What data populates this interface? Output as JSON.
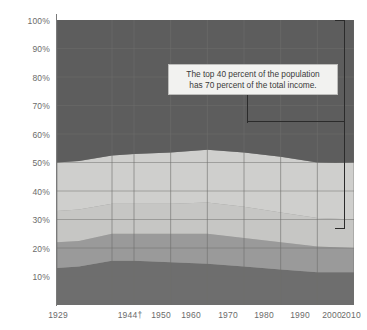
{
  "chart_data": {
    "type": "area",
    "title": "",
    "subtitle": "",
    "xlabel": "",
    "ylabel": "",
    "stacked": true,
    "grid": true,
    "legend_position": "none",
    "ylim": [
      0,
      100
    ],
    "yticks": [
      "10%",
      "20%",
      "30%",
      "40%",
      "50%",
      "60%",
      "70%",
      "80%",
      "90%",
      "100%"
    ],
    "ytick_values": [
      10,
      20,
      30,
      40,
      50,
      60,
      70,
      80,
      90,
      100
    ],
    "xlim": [
      1929,
      2010
    ],
    "xticks": [
      "1929",
      "1944†",
      "1950",
      "1960",
      "1970",
      "1980",
      "1990",
      "2000",
      "2010"
    ],
    "xtick_values": [
      1929,
      1944,
      1950,
      1960,
      1970,
      1980,
      1990,
      2000,
      2010
    ],
    "x": [
      1929,
      1935,
      1944,
      1950,
      1960,
      1970,
      1980,
      1990,
      2000,
      2005,
      2010
    ],
    "series": [
      {
        "name": "lowest-quintile",
        "color": "#6e6e6e",
        "values": [
          13.0,
          13.5,
          15.5,
          15.5,
          15.0,
          14.5,
          13.5,
          12.5,
          11.5,
          11.5,
          11.5
        ]
      },
      {
        "name": "second-quintile",
        "color": "#9a9a9a",
        "values": [
          9.0,
          9.0,
          9.5,
          9.5,
          10.0,
          10.5,
          10.0,
          9.5,
          9.0,
          8.8,
          8.5
        ]
      },
      {
        "name": "middle-quintile",
        "color": "#c6c6c4",
        "values": [
          11.0,
          11.0,
          10.5,
          10.5,
          10.5,
          11.0,
          11.0,
          10.5,
          10.0,
          10.0,
          10.0
        ]
      },
      {
        "name": "fourth-quintile",
        "color": "#cfcfcd",
        "values": [
          17.0,
          17.0,
          17.0,
          17.5,
          18.0,
          18.5,
          19.0,
          19.5,
          19.5,
          19.5,
          20.0
        ]
      },
      {
        "name": "highest-quintile",
        "color": "#5d5d5d",
        "values": [
          50.0,
          49.5,
          47.5,
          47.0,
          46.5,
          45.5,
          46.5,
          48.0,
          50.0,
          50.2,
          50.0
        ]
      }
    ],
    "boundaries_pct": {
      "note": "cumulative top edge of each band, bottom-up",
      "band1": [
        13.0,
        13.5,
        15.5,
        15.5,
        15.0,
        14.5,
        13.5,
        12.5,
        11.5,
        11.5,
        11.5
      ],
      "band2": [
        22.0,
        22.5,
        25.0,
        25.0,
        25.0,
        25.0,
        23.5,
        22.0,
        20.5,
        20.3,
        20.0
      ],
      "band3": [
        33.0,
        33.5,
        35.5,
        35.5,
        35.5,
        36.0,
        34.5,
        32.5,
        30.5,
        30.3,
        30.0
      ],
      "band4": [
        50.0,
        50.5,
        52.5,
        53.0,
        53.5,
        54.5,
        53.5,
        52.0,
        50.0,
        50.0,
        50.0
      ],
      "band5": [
        100,
        100,
        100,
        100,
        100,
        100,
        100,
        100,
        100,
        100,
        100
      ]
    },
    "annotations": [
      {
        "name": "top-40-callout",
        "line1": "The top 40 percent of the population",
        "line2": "has 70 percent of the total income."
      }
    ],
    "bracket": {
      "name": "top-40-bracket",
      "from_pct": 100,
      "to_pct": 30,
      "at_year": 2010
    }
  },
  "colors": {
    "plot_background": "#8c8c8a",
    "grid": "#6f6f6d",
    "axis": "#7a7a7a",
    "tick_text": "#6b6b6b",
    "annotation_text": "#3a3a3a",
    "annotation_bg": "#f2f2f0",
    "annotation_border": "#bdbdbb",
    "bracket": "#2b2b2b"
  }
}
